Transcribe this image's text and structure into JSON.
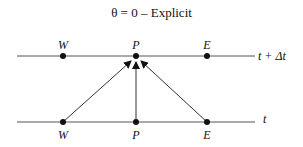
{
  "title": "θ = 0 – Explicit",
  "time_levels": {
    "upper": "t + Δt",
    "lower": "t"
  },
  "nodes": {
    "upper": [
      "W",
      "P",
      "E"
    ],
    "lower": [
      "W",
      "P",
      "E"
    ]
  },
  "arrows": [
    {
      "from": "W (t)",
      "to": "P (t + Δt)"
    },
    {
      "from": "P (t)",
      "to": "P (t + Δt)"
    },
    {
      "from": "E (t)",
      "to": "P (t + Δt)"
    }
  ],
  "colors": {
    "line": "#555555",
    "node": "#111111",
    "text": "#111111"
  }
}
